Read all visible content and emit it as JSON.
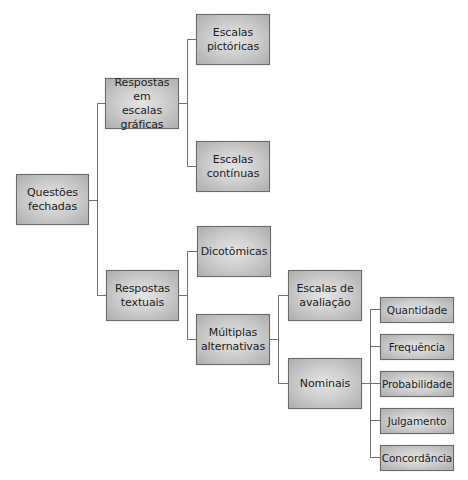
{
  "diagram": {
    "colors": {
      "box_center": "#e4e4e4",
      "box_edge": "#adadad",
      "border": "#6a6a6a",
      "line": "#707070",
      "text": "#1e1e1e"
    },
    "nodes": {
      "questoes_fechadas": "Questões\nfechadas",
      "respostas_escalas_graficas": "Respostas em\nescalas gráficas",
      "escalas_pictoricas": "Escalas\npictóricas",
      "escalas_continuas": "Escalas\ncontínuas",
      "respostas_textuais": "Respostas\ntextuais",
      "dicotomicas": "Dicotômicas",
      "multiplas_alternativas": "Múltiplas\nalternativas",
      "escalas_avaliacao": "Escalas de\navaliação",
      "nominais": "Nominais",
      "quantidade": "Quantidade",
      "frequencia": "Frequência",
      "probabilidade": "Probabilidade",
      "julgamento": "Julgamento",
      "concordancia": "Concordância"
    },
    "edges": [
      [
        "questoes_fechadas",
        "respostas_escalas_graficas"
      ],
      [
        "questoes_fechadas",
        "respostas_textuais"
      ],
      [
        "respostas_escalas_graficas",
        "escalas_pictoricas"
      ],
      [
        "respostas_escalas_graficas",
        "escalas_continuas"
      ],
      [
        "respostas_textuais",
        "dicotomicas"
      ],
      [
        "respostas_textuais",
        "multiplas_alternativas"
      ],
      [
        "multiplas_alternativas",
        "escalas_avaliacao"
      ],
      [
        "multiplas_alternativas",
        "nominais"
      ],
      [
        "nominais",
        "quantidade"
      ],
      [
        "nominais",
        "frequencia"
      ],
      [
        "nominais",
        "probabilidade"
      ],
      [
        "nominais",
        "julgamento"
      ],
      [
        "nominais",
        "concordancia"
      ]
    ]
  }
}
